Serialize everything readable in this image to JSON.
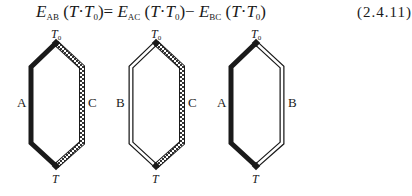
{
  "equation": {
    "lhs": {
      "symbol": "E",
      "subscript": "AB",
      "args": "T, T₀"
    },
    "rhs_term1": {
      "symbol": "E",
      "subscript": "AC",
      "args": "T, T₀"
    },
    "rhs_term2": {
      "symbol": "E",
      "subscript": "BC",
      "args": "T, T₀"
    },
    "equals": "=",
    "minus": "−",
    "open_paren": "(",
    "close_paren": ")",
    "arg_T": "T",
    "arg_sep": "·",
    "arg_T0_base": "T",
    "arg_T0_sub": "0",
    "number": "(2.4.11)"
  },
  "diagrams": [
    {
      "id": "AC",
      "left_label": "A",
      "right_label": "C",
      "left_style": "solid",
      "right_style": "hatched",
      "top_label": "T",
      "top_sub": "0",
      "bottom_label": "T"
    },
    {
      "id": "BC",
      "left_label": "B",
      "right_label": "C",
      "left_style": "double",
      "right_style": "hatched",
      "top_label": "T",
      "top_sub": "0",
      "bottom_label": "T"
    },
    {
      "id": "AB",
      "left_label": "A",
      "right_label": "B",
      "left_style": "solid",
      "right_style": "double",
      "top_label": "T",
      "top_sub": "0",
      "bottom_label": "T"
    }
  ],
  "colors": {
    "ink": "#1a1a1a",
    "background": "#ffffff"
  }
}
